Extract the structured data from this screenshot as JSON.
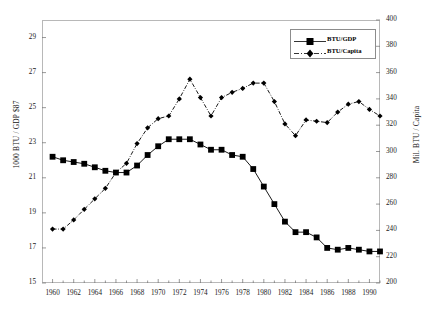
{
  "chart_data": {
    "type": "line",
    "title": "",
    "xlabel": "",
    "ylabel": "1000 BTU / GDP $87",
    "ylabel_secondary": "Mil. BTU / Capita",
    "grid": false,
    "legend_position": "top-right",
    "xlim": [
      1959,
      1991
    ],
    "ylim": [
      15,
      30
    ],
    "ylim_secondary": [
      200,
      400
    ],
    "ytick_labels": [
      "15",
      "17",
      "19",
      "21",
      "23",
      "25",
      "27",
      "29"
    ],
    "ytick_values": [
      15,
      17,
      19,
      21,
      23,
      25,
      27,
      29
    ],
    "ytick_labels_secondary": [
      "200",
      "220",
      "240",
      "260",
      "280",
      "300",
      "320",
      "340",
      "360",
      "380",
      "400"
    ],
    "ytick_values_secondary": [
      200,
      220,
      240,
      260,
      280,
      300,
      320,
      340,
      360,
      380,
      400
    ],
    "xtick_labels": [
      "1960",
      "1962",
      "1964",
      "1966",
      "1968",
      "1970",
      "1972",
      "1974",
      "1976",
      "1978",
      "1980",
      "1982",
      "1984",
      "1986",
      "1988",
      "1990"
    ],
    "xtick_values": [
      1960,
      1962,
      1964,
      1966,
      1968,
      1970,
      1972,
      1974,
      1976,
      1978,
      1980,
      1982,
      1984,
      1986,
      1988,
      1990
    ],
    "x": [
      1960,
      1961,
      1962,
      1963,
      1964,
      1965,
      1966,
      1967,
      1968,
      1969,
      1970,
      1971,
      1972,
      1973,
      1974,
      1975,
      1976,
      1977,
      1978,
      1979,
      1980,
      1981,
      1982,
      1983,
      1984,
      1985,
      1986,
      1987,
      1988,
      1989,
      1990,
      1991
    ],
    "series": [
      {
        "name": "BTU/GDP",
        "axis": "left",
        "marker": "square",
        "linestyle": "solid",
        "color": "#000000",
        "values": [
          22.2,
          22.0,
          21.9,
          21.8,
          21.6,
          21.4,
          21.3,
          21.3,
          21.7,
          22.3,
          22.8,
          23.2,
          23.2,
          23.2,
          22.9,
          22.6,
          22.6,
          22.3,
          22.2,
          21.5,
          20.5,
          19.5,
          18.5,
          17.9,
          17.9,
          17.6,
          17.0,
          16.9,
          17.0,
          16.9,
          16.8,
          16.8
        ]
      },
      {
        "name": "BTU/Capita",
        "axis": "right",
        "marker": "diamond",
        "linestyle": "dashdot",
        "color": "#000000",
        "values": [
          241,
          241,
          248,
          256,
          264,
          272,
          284,
          291,
          306,
          318,
          325,
          327,
          340,
          355,
          341,
          327,
          341,
          345,
          348,
          352,
          352,
          338,
          321,
          312,
          324,
          323,
          322,
          330,
          336,
          338,
          332,
          327
        ]
      }
    ]
  },
  "legend": {
    "items": [
      {
        "label": "BTU/GDP"
      },
      {
        "label": "BTU/Capita"
      }
    ]
  },
  "axes": {
    "left_title": "1000 BTU / GDP $87",
    "right_title": "Mil. BTU / Capita"
  }
}
